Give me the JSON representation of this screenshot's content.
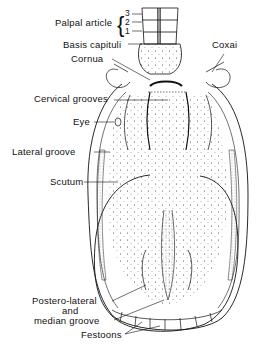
{
  "figure": {
    "labels": {
      "palpal_article": "Palpal article",
      "palpal_numbers": [
        "3",
        "2",
        "1"
      ],
      "basis_capituli": "Basis capituli",
      "coxai": "Coxai",
      "cornua": "Cornua",
      "cervical_grooves": "Cervical grooves",
      "eye": "Eye",
      "lateral_groove": "Lateral groove",
      "scutum": "Scutum",
      "postero_lateral_line1": "Postero-lateral",
      "postero_lateral_line2": "and",
      "postero_lateral_line3": "median groove",
      "festoons": "Festoons"
    },
    "colors": {
      "ink": "#111111",
      "background": "#ffffff",
      "stipple": "#555555"
    }
  }
}
